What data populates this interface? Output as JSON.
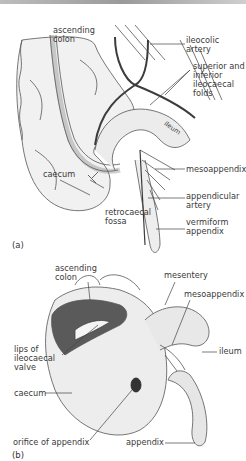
{
  "panel_a": {
    "letter": "(a)",
    "labels": {
      "ascending_colon": "ascending\ncolon",
      "ileocolic_artery": "ileocolic\nartery",
      "ileocaecal_folds": "superior and\ninferior\nileocaecal\nfolds",
      "ileum": "ileum",
      "caecum": "caecum",
      "mesoappendix": "mesoappendix",
      "appendicular_artery": "appendicular\nartery",
      "retrocaecal_fossa": "retrocaecal\nfossa",
      "vermiform_appendix": "vermiform\nappendix"
    }
  },
  "panel_b": {
    "letter": "(b)",
    "labels": {
      "ascending_colon": "ascending\ncolon",
      "mesentery": "mesentery",
      "mesoappendix": "mesoappendix",
      "lips_of_valve": "lips of\nileocaecal\nvalve",
      "ileum": "ileum",
      "caecum": "caecum",
      "orifice_of_appendix": "orifice of appendix",
      "appendix": "appendix"
    }
  },
  "colors": {
    "artery": "#3c3c3c",
    "outline": "#555555",
    "shade": "#e6e6e6",
    "leader": "#444444"
  }
}
